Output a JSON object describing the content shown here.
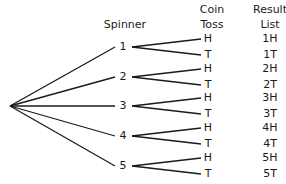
{
  "headers": {
    "spinner": "Spinner",
    "coin_line1": "Coin",
    "coin_line2": "Toss",
    "result_line1": "Result",
    "result_line2": "List"
  },
  "tree": {
    "root": {
      "x": 10,
      "y": 106
    },
    "spinner": [
      {
        "label": "1",
        "y": 47
      },
      {
        "label": "2",
        "y": 77
      },
      {
        "label": "3",
        "y": 106
      },
      {
        "label": "4",
        "y": 136
      },
      {
        "label": "5",
        "y": 166
      }
    ],
    "coin": [
      {
        "label": "H",
        "y": 39
      },
      {
        "label": "T",
        "y": 55
      },
      {
        "label": "H",
        "y": 69
      },
      {
        "label": "T",
        "y": 85
      },
      {
        "label": "H",
        "y": 98
      },
      {
        "label": "T",
        "y": 114
      },
      {
        "label": "H",
        "y": 128
      },
      {
        "label": "T",
        "y": 144
      },
      {
        "label": "H",
        "y": 158
      },
      {
        "label": "T",
        "y": 174
      }
    ],
    "results": [
      "1H",
      "1T",
      "2H",
      "2T",
      "3H",
      "3T",
      "4H",
      "4T",
      "5H",
      "5T"
    ]
  },
  "colors": {
    "line": "#1a1a1a",
    "text": "#1a1a1a"
  }
}
